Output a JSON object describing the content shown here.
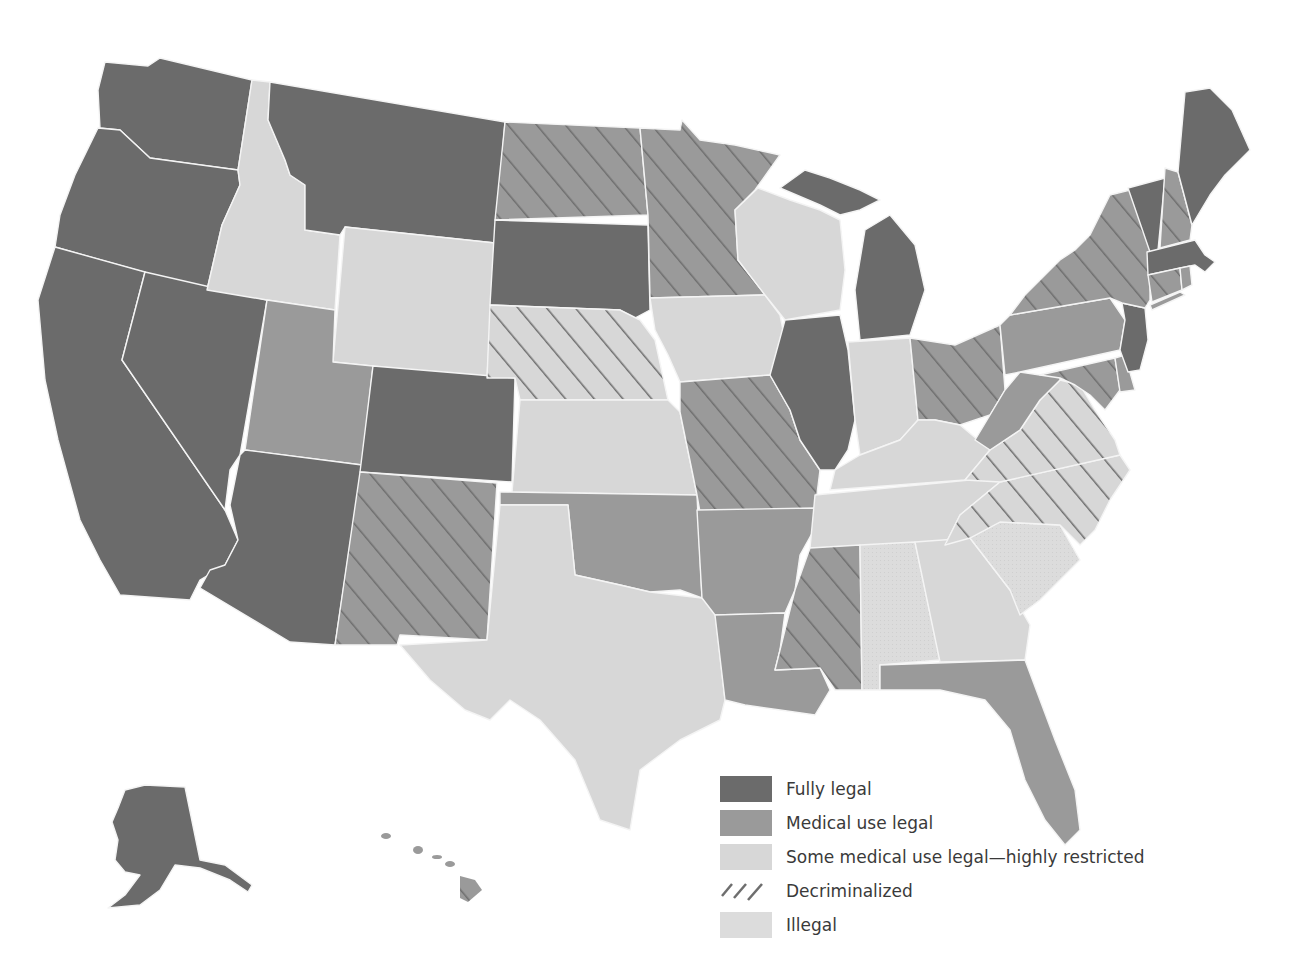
{
  "title_fragment": "",
  "colors": {
    "fully_legal": "#6b6b6b",
    "medical_use_legal": "#9a9a9a",
    "some_medical_restricted": "#d7d7d7",
    "illegal": "#dcdcdc",
    "hatch_line": "#6e6e6e",
    "border": "#f4f4f4"
  },
  "legend": {
    "items": [
      {
        "key": "fully_legal",
        "label": "Fully legal"
      },
      {
        "key": "medical_use_legal",
        "label": "Medical use legal"
      },
      {
        "key": "some_medical_restricted",
        "label": "Some medical use legal—highly restricted"
      },
      {
        "key": "decriminalized",
        "label": "Decriminalized"
      },
      {
        "key": "illegal",
        "label": "Illegal"
      }
    ]
  },
  "states": {
    "fully_legal": [
      "Washington",
      "Oregon",
      "California",
      "Nevada",
      "Montana",
      "Arizona",
      "Colorado",
      "South Dakota",
      "Illinois",
      "Michigan",
      "New Jersey",
      "Vermont",
      "Maine",
      "Massachusetts",
      "Alaska",
      "New Mexico*"
    ],
    "medical_use_legal": [
      "Utah",
      "Oklahoma",
      "Arkansas",
      "Louisiana",
      "Florida",
      "Pennsylvania",
      "West Virginia",
      "Hawaii",
      "Maryland",
      "Delaware"
    ],
    "medical_use_legal_decriminalized": [
      "North Dakota",
      "Minnesota",
      "Missouri",
      "Mississippi",
      "Ohio",
      "New York",
      "New Hampshire",
      "Connecticut",
      "Rhode Island",
      "New Mexico"
    ],
    "some_medical_restricted": [
      "Idaho",
      "Wyoming",
      "Wisconsin",
      "Iowa",
      "Kansas",
      "Texas",
      "Indiana",
      "Kentucky",
      "Tennessee",
      "Georgia"
    ],
    "some_medical_restricted_decriminalized": [
      "Nebraska",
      "Virginia",
      "North Carolina"
    ],
    "illegal": [
      "Alabama",
      "South Carolina"
    ]
  }
}
